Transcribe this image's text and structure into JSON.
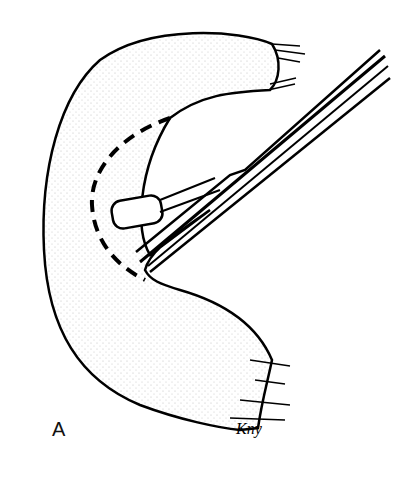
{
  "figure": {
    "panel_label": "A",
    "artist_signature": "Kny",
    "colors": {
      "ink": "#000000",
      "background": "#ffffff"
    }
  }
}
